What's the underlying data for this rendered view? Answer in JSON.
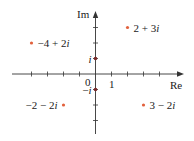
{
  "diagram": {
    "type": "complex-plane",
    "axes": {
      "x_label": "Re",
      "y_label": "Im",
      "origin_label": "0",
      "x_unit_label": "1",
      "color": "#333333"
    },
    "origin_px": [
      95.5,
      74
    ],
    "unit_px": {
      "x": 16,
      "y": 15.5
    },
    "x_ticks": [
      -4,
      -3,
      -2,
      -1,
      1,
      2,
      3,
      4
    ],
    "y_ticks": [
      -3,
      -2,
      -1,
      1,
      2,
      3
    ],
    "point_color": "#e2613c",
    "axis_point_color": "#7a2a2a",
    "points": [
      {
        "re": 2,
        "im": 3,
        "label": "2 + 3i",
        "side": "right"
      },
      {
        "re": -4,
        "im": 2,
        "label": "−4 + 2i",
        "side": "right"
      },
      {
        "re": 0,
        "im": 1,
        "label": "i",
        "side": "left",
        "on_axis": true
      },
      {
        "re": 0,
        "im": -1,
        "label": "−i",
        "side": "left",
        "on_axis": true
      },
      {
        "re": -2,
        "im": -2,
        "label": "−2 − 2i",
        "side": "left"
      },
      {
        "re": 3,
        "im": -2,
        "label": "3 − 2i",
        "side": "right"
      }
    ]
  }
}
